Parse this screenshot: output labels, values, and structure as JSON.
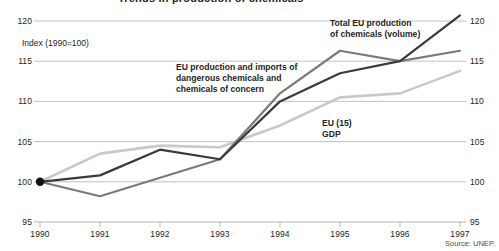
{
  "title": "Trends in production of chemicals",
  "index_note": "Index (1990=100)",
  "source": "Source: UNEP.",
  "annotations": {
    "total": "Total EU production\nof chemicals (volume)",
    "dangerous": "EU production and imports of\ndangerous chemicals and\nchemicals of concern",
    "gdp": "EU (15)\nGDP"
  },
  "colors": {
    "total_eu_production": "#3a3a3a",
    "dangerous_chemicals": "#7a7a7a",
    "eu15_gdp": "#c9c9c9",
    "gridline": "#b3b3b3",
    "text": "#231f20"
  },
  "chart_data": {
    "type": "line",
    "title": "Trends in production of chemicals",
    "xlabel": "",
    "ylabel": "Index (1990=100)",
    "x": [
      1990,
      1991,
      1992,
      1993,
      1994,
      1995,
      1996,
      1997
    ],
    "xticklabels": [
      "1990",
      "1991",
      "1992",
      "1993",
      "1994",
      "1995",
      "1996",
      "1997"
    ],
    "yticklabels": [
      "95",
      "100",
      "105",
      "110",
      "115",
      "120"
    ],
    "ylim": [
      95,
      120
    ],
    "xlim": [
      1990,
      1997
    ],
    "grid": true,
    "legend": "inline-annotations",
    "origin_marker": {
      "x": 1990,
      "y": 100,
      "shape": "dot"
    },
    "series": [
      {
        "name": "Total EU production of chemicals (volume)",
        "color": "#3a3a3a",
        "values": [
          100.0,
          100.8,
          104.0,
          102.8,
          110.0,
          113.5,
          115.0,
          120.7
        ]
      },
      {
        "name": "EU production and imports of dangerous chemicals and chemicals of concern",
        "color": "#7a7a7a",
        "values": [
          100.0,
          98.2,
          100.5,
          102.8,
          111.0,
          116.3,
          115.0,
          116.3
        ]
      },
      {
        "name": "EU (15) GDP",
        "color": "#c9c9c9",
        "values": [
          100.0,
          103.5,
          104.5,
          104.3,
          107.0,
          110.5,
          111.0,
          113.8
        ]
      }
    ]
  }
}
